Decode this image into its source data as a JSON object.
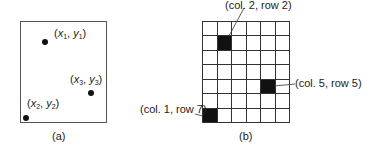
{
  "panel_a": {
    "caption": "(a)",
    "points": [
      {
        "x_var": "x",
        "y_var": "y",
        "sub": "1",
        "left": 42,
        "top": 39,
        "label_left": 54,
        "label_top": 27
      },
      {
        "x_var": "x",
        "y_var": "y",
        "sub": "2",
        "left": 23,
        "top": 115,
        "label_left": 27,
        "label_top": 97
      },
      {
        "x_var": "x",
        "y_var": "y",
        "sub": "3",
        "left": 88,
        "top": 90,
        "label_left": 70,
        "label_top": 73
      }
    ]
  },
  "panel_b": {
    "caption": "(b)",
    "columns": 6,
    "rows": 7,
    "filled_cells": [
      {
        "col": 2,
        "row": 2,
        "label": "(col. 2, row 2)"
      },
      {
        "col": 5,
        "row": 5,
        "label": "(col. 5, row 5)"
      },
      {
        "col": 1,
        "row": 7,
        "label": "(col. 1, row 7)"
      }
    ]
  },
  "colors": {
    "ink": "#111111",
    "grid_line": "#333333",
    "background": "#ffffff"
  }
}
